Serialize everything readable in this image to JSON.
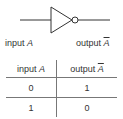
{
  "diagram": {
    "input_label": {
      "prefix": "input ",
      "var": "A"
    },
    "output_label": {
      "prefix": "output ",
      "var": "A",
      "negated": true
    }
  },
  "truth_table": {
    "headers": [
      {
        "prefix": "input ",
        "var": "A"
      },
      {
        "prefix": "output ",
        "var": "A",
        "negated": true
      }
    ],
    "rows": [
      [
        "0",
        "1"
      ],
      [
        "1",
        "0"
      ]
    ]
  },
  "colors": {
    "line": "#333333",
    "border": "#777777",
    "background": "#ffffff"
  }
}
